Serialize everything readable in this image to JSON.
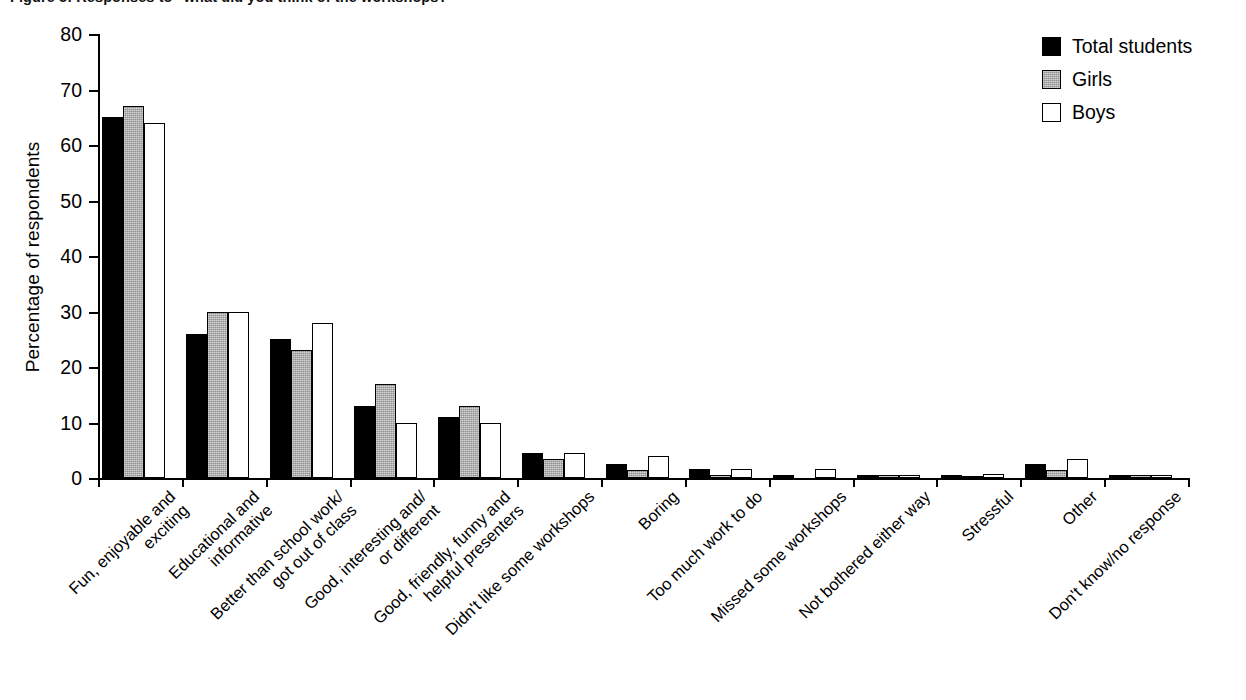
{
  "figure": {
    "title_clipped": "Figure 5: Responses to \"what did you think of the workshops?\"",
    "background": "#ffffff"
  },
  "legend": {
    "position": "top-right",
    "entries": [
      {
        "label": "Total students",
        "swatch": "black-filled-square",
        "color": "#000000"
      },
      {
        "label": "Girls",
        "swatch": "gray-hatched-square",
        "color": "#8e8e8e"
      },
      {
        "label": "Boys",
        "swatch": "white-outlined-square",
        "color": "#ffffff"
      }
    ]
  },
  "chart_data": {
    "type": "bar",
    "title": "Figure 5: Responses to \"what did you think of the workshops?\"",
    "xlabel": "",
    "ylabel": "Percentage of respondents",
    "ylim": [
      0,
      80
    ],
    "yticks": [
      0,
      10,
      20,
      30,
      40,
      50,
      60,
      70,
      80
    ],
    "grid": false,
    "legend_position": "top-right",
    "categories": [
      "Fun, enjoyable and\nexciting",
      "Educational and\ninformative",
      "Better than school work/\ngot out of class",
      "Good, interesting and/\nor different",
      "Good, friendly, funny and\nhelpful presenters",
      "Didn't like some workshops",
      "Boring",
      "Too much work to do",
      "Missed some workshops",
      "Not bothered either way",
      "Stressful",
      "Other",
      "Don't know/no response"
    ],
    "series": [
      {
        "name": "Total students",
        "values": [
          65,
          26,
          25,
          13,
          11,
          4.5,
          2.5,
          1.7,
          0.5,
          0.5,
          0.5,
          2.5,
          0.5
        ]
      },
      {
        "name": "Girls",
        "values": [
          67,
          30,
          23,
          17,
          13,
          3.5,
          1.5,
          0.5,
          0,
          0.5,
          0.2,
          1.5,
          0.5
        ]
      },
      {
        "name": "Boys",
        "values": [
          64,
          30,
          28,
          10,
          10,
          4.5,
          4,
          1.7,
          1.7,
          0.5,
          0.7,
          3.5,
          0.5
        ]
      }
    ]
  }
}
